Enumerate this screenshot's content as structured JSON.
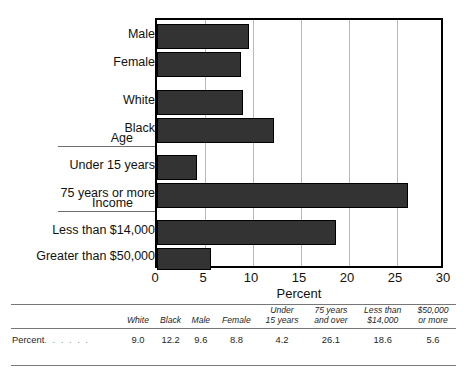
{
  "chart_data": {
    "type": "bar",
    "orientation": "horizontal",
    "title": "",
    "xlabel": "Percent",
    "ylabel": "",
    "xlim": [
      0,
      30
    ],
    "xticks": [
      0,
      5,
      10,
      15,
      20,
      25,
      30
    ],
    "xtick_labels": [
      "0",
      "5",
      "10",
      "15",
      "20",
      "25",
      "30"
    ],
    "grid": "vertical",
    "legend": "none",
    "bar_color": "#333333",
    "categories": [
      "Male",
      "Female",
      "White",
      "Black",
      "Under 15 years",
      "75 years or more",
      "Less than $14,000",
      "Greater than $50,000"
    ],
    "values": [
      9.6,
      8.8,
      9.0,
      12.2,
      4.2,
      26.1,
      18.6,
      5.6
    ],
    "group_labels": [
      "Age",
      "Income"
    ],
    "annotations": []
  },
  "chart": {
    "axis_title": "Percent",
    "bars": [
      {
        "label": "Male",
        "value": 9.6,
        "top": 22,
        "height": 25
      },
      {
        "label": "Female",
        "value": 8.8,
        "top": 50,
        "height": 25
      },
      {
        "label": "White",
        "value": 9.0,
        "top": 88,
        "height": 25
      },
      {
        "label": "Black",
        "value": 12.2,
        "top": 116,
        "height": 25
      },
      {
        "label": "Under 15 years",
        "value": 4.2,
        "top": 153,
        "height": 25
      },
      {
        "label": "75 years or more",
        "value": 26.1,
        "top": 181,
        "height": 25
      },
      {
        "label": "Less than $14,000",
        "value": 18.6,
        "top": 218,
        "height": 25
      },
      {
        "label": "Greater than $50,000",
        "value": 5.6,
        "top": 246,
        "height": 22
      }
    ],
    "groups": [
      {
        "label": "Age",
        "top": 131
      },
      {
        "label": "Income",
        "top": 196
      }
    ],
    "ticks": [
      {
        "label": "0",
        "value": 0
      },
      {
        "label": "5",
        "value": 5
      },
      {
        "label": "10",
        "value": 10
      },
      {
        "label": "15",
        "value": 15
      },
      {
        "label": "20",
        "value": 20
      },
      {
        "label": "25",
        "value": 25
      },
      {
        "label": "30",
        "value": 30
      }
    ]
  },
  "table": {
    "corner_label": "",
    "row_label": "Percent",
    "row_label_dots": ". . . . . .",
    "headers": [
      "White",
      "Black",
      "Male",
      "Female",
      "Under\n15 years",
      "75 years\nand over",
      "Less than\n$14,000",
      "$50,000\nor more"
    ],
    "headers_lines": [
      [
        "White",
        ""
      ],
      [
        "Black",
        ""
      ],
      [
        "Male",
        ""
      ],
      [
        "Female",
        ""
      ],
      [
        "Under",
        "15 years"
      ],
      [
        "75 years",
        "and over"
      ],
      [
        "Less than",
        "$14,000"
      ],
      [
        "$50,000",
        "or more"
      ]
    ],
    "values": [
      "9.0",
      "12.2",
      "9.6",
      "8.8",
      "4.2",
      "26.1",
      "18.6",
      "5.6"
    ]
  }
}
